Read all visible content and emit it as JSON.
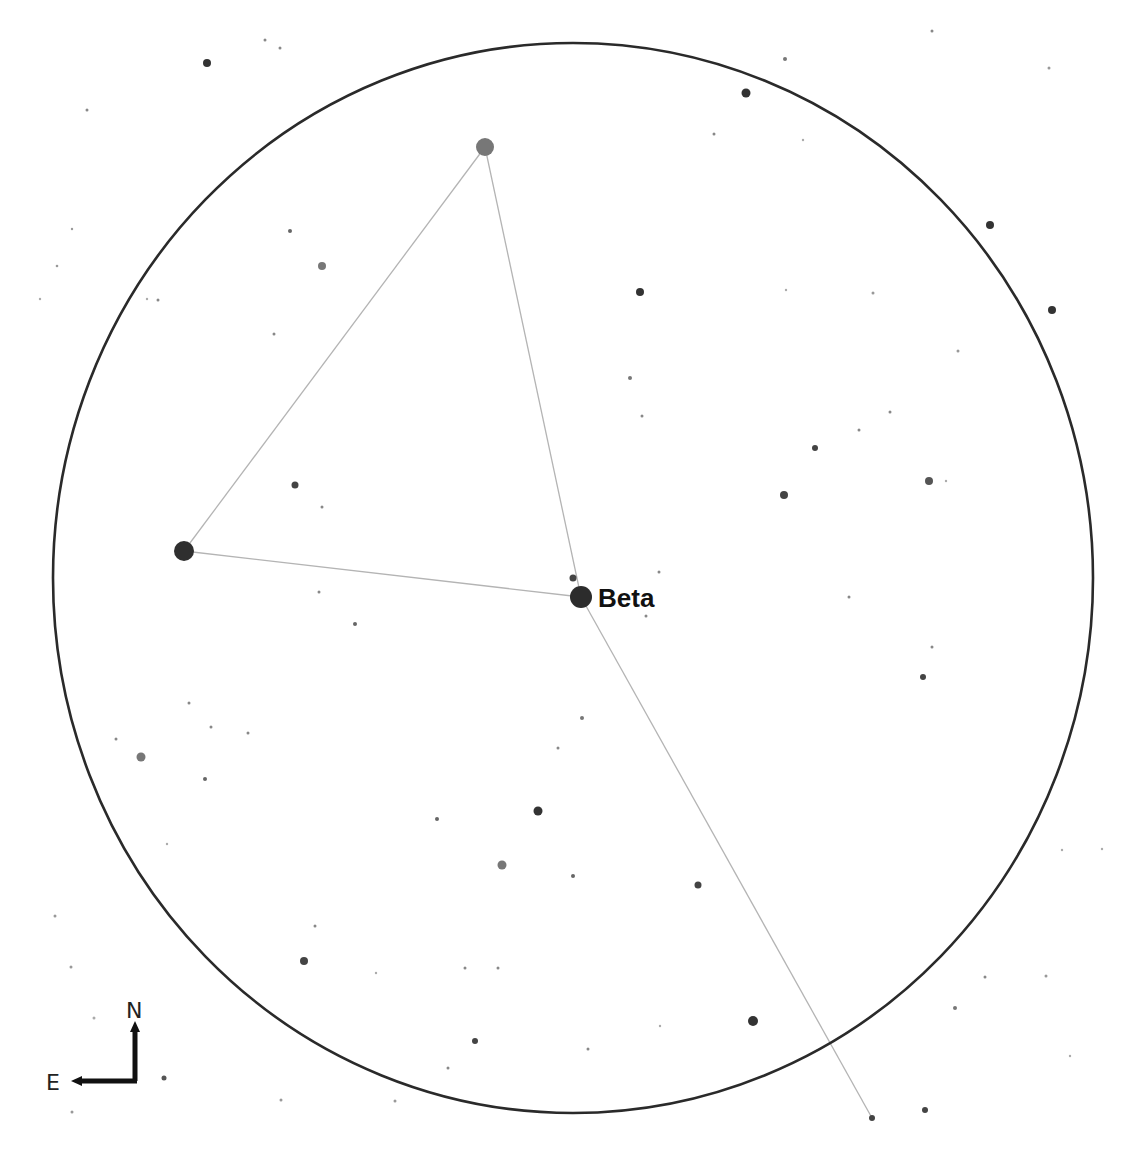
{
  "chart": {
    "background": "#ffffff",
    "fov_circle": {
      "cx": 573,
      "cy": 578,
      "rx": 520,
      "ry": 535,
      "color": "#2a2a2a"
    },
    "label": {
      "text": "Beta",
      "x": 598,
      "y": 607,
      "star_index": 0
    },
    "compass": {
      "north_label": "N",
      "east_label": "E"
    },
    "asterism_lines": [
      {
        "from": [
          485,
          147
        ],
        "to": [
          184,
          551
        ]
      },
      {
        "from": [
          485,
          147
        ],
        "to": [
          581,
          597
        ]
      },
      {
        "from": [
          184,
          551
        ],
        "to": [
          581,
          597
        ]
      },
      {
        "from": [
          581,
          597
        ],
        "to": [
          872,
          1118
        ]
      }
    ],
    "stars": [
      {
        "name": "Beta",
        "x": 581,
        "y": 597,
        "r": 11,
        "color": "#2c2c2c"
      },
      {
        "x": 485,
        "y": 147,
        "r": 9,
        "color": "#777777"
      },
      {
        "x": 184,
        "y": 551,
        "r": 10,
        "color": "#2f2f2f"
      },
      {
        "x": 573,
        "y": 578,
        "r": 3.5,
        "color": "#444444"
      },
      {
        "x": 207,
        "y": 63,
        "r": 4,
        "color": "#333333"
      },
      {
        "x": 265,
        "y": 40,
        "r": 1.5,
        "color": "#888888"
      },
      {
        "x": 280,
        "y": 48,
        "r": 1.5,
        "color": "#888888"
      },
      {
        "x": 87,
        "y": 110,
        "r": 1.5,
        "color": "#888888"
      },
      {
        "x": 72,
        "y": 229,
        "r": 1.2,
        "color": "#999999"
      },
      {
        "x": 57,
        "y": 266,
        "r": 1.3,
        "color": "#999999"
      },
      {
        "x": 40,
        "y": 299,
        "r": 1.2,
        "color": "#aaaaaa"
      },
      {
        "x": 147,
        "y": 299,
        "r": 1.2,
        "color": "#aaaaaa"
      },
      {
        "x": 290,
        "y": 231,
        "r": 2,
        "color": "#666666"
      },
      {
        "x": 322,
        "y": 266,
        "r": 4,
        "color": "#777777"
      },
      {
        "x": 158,
        "y": 300,
        "r": 1.5,
        "color": "#888888"
      },
      {
        "x": 274,
        "y": 334,
        "r": 1.5,
        "color": "#888888"
      },
      {
        "x": 295,
        "y": 485,
        "r": 3.5,
        "color": "#444444"
      },
      {
        "x": 322,
        "y": 507,
        "r": 1.5,
        "color": "#888888"
      },
      {
        "x": 319,
        "y": 592,
        "r": 1.5,
        "color": "#888888"
      },
      {
        "x": 355,
        "y": 624,
        "r": 2,
        "color": "#666666"
      },
      {
        "x": 746,
        "y": 93,
        "r": 4.5,
        "color": "#333333"
      },
      {
        "x": 785,
        "y": 59,
        "r": 2,
        "color": "#777777"
      },
      {
        "x": 932,
        "y": 31,
        "r": 1.5,
        "color": "#888888"
      },
      {
        "x": 1049,
        "y": 68,
        "r": 1.5,
        "color": "#999999"
      },
      {
        "x": 714,
        "y": 134,
        "r": 1.5,
        "color": "#888888"
      },
      {
        "x": 803,
        "y": 140,
        "r": 1.2,
        "color": "#aaaaaa"
      },
      {
        "x": 990,
        "y": 225,
        "r": 4,
        "color": "#333333"
      },
      {
        "x": 640,
        "y": 292,
        "r": 4,
        "color": "#333333"
      },
      {
        "x": 786,
        "y": 290,
        "r": 1.2,
        "color": "#aaaaaa"
      },
      {
        "x": 873,
        "y": 293,
        "r": 1.5,
        "color": "#999999"
      },
      {
        "x": 1052,
        "y": 310,
        "r": 4,
        "color": "#333333"
      },
      {
        "x": 958,
        "y": 351,
        "r": 1.5,
        "color": "#999999"
      },
      {
        "x": 630,
        "y": 378,
        "r": 2,
        "color": "#777777"
      },
      {
        "x": 642,
        "y": 416,
        "r": 1.5,
        "color": "#888888"
      },
      {
        "x": 890,
        "y": 412,
        "r": 1.5,
        "color": "#888888"
      },
      {
        "x": 859,
        "y": 430,
        "r": 1.5,
        "color": "#888888"
      },
      {
        "x": 815,
        "y": 448,
        "r": 3,
        "color": "#444444"
      },
      {
        "x": 784,
        "y": 495,
        "r": 4,
        "color": "#444444"
      },
      {
        "x": 929,
        "y": 481,
        "r": 4,
        "color": "#555555"
      },
      {
        "x": 946,
        "y": 481,
        "r": 1.2,
        "color": "#aaaaaa"
      },
      {
        "x": 659,
        "y": 572,
        "r": 1.5,
        "color": "#888888"
      },
      {
        "x": 646,
        "y": 616,
        "r": 1.5,
        "color": "#888888"
      },
      {
        "x": 849,
        "y": 597,
        "r": 1.5,
        "color": "#888888"
      },
      {
        "x": 932,
        "y": 647,
        "r": 1.5,
        "color": "#888888"
      },
      {
        "x": 923,
        "y": 677,
        "r": 3,
        "color": "#444444"
      },
      {
        "x": 189,
        "y": 703,
        "r": 1.5,
        "color": "#888888"
      },
      {
        "x": 116,
        "y": 739,
        "r": 1.5,
        "color": "#888888"
      },
      {
        "x": 211,
        "y": 727,
        "r": 1.5,
        "color": "#888888"
      },
      {
        "x": 248,
        "y": 733,
        "r": 1.5,
        "color": "#888888"
      },
      {
        "x": 141,
        "y": 757,
        "r": 4.5,
        "color": "#777777"
      },
      {
        "x": 205,
        "y": 779,
        "r": 2,
        "color": "#666666"
      },
      {
        "x": 167,
        "y": 844,
        "r": 1.2,
        "color": "#aaaaaa"
      },
      {
        "x": 582,
        "y": 718,
        "r": 2,
        "color": "#777777"
      },
      {
        "x": 558,
        "y": 748,
        "r": 1.5,
        "color": "#888888"
      },
      {
        "x": 437,
        "y": 819,
        "r": 2,
        "color": "#666666"
      },
      {
        "x": 538,
        "y": 811,
        "r": 4.5,
        "color": "#333333"
      },
      {
        "x": 502,
        "y": 865,
        "r": 4.5,
        "color": "#777777"
      },
      {
        "x": 573,
        "y": 876,
        "r": 2,
        "color": "#666666"
      },
      {
        "x": 698,
        "y": 885,
        "r": 3.5,
        "color": "#444444"
      },
      {
        "x": 55,
        "y": 916,
        "r": 1.5,
        "color": "#999999"
      },
      {
        "x": 315,
        "y": 926,
        "r": 1.5,
        "color": "#888888"
      },
      {
        "x": 304,
        "y": 961,
        "r": 4,
        "color": "#444444"
      },
      {
        "x": 376,
        "y": 973,
        "r": 1.2,
        "color": "#aaaaaa"
      },
      {
        "x": 465,
        "y": 968,
        "r": 1.5,
        "color": "#888888"
      },
      {
        "x": 498,
        "y": 968,
        "r": 1.5,
        "color": "#888888"
      },
      {
        "x": 71,
        "y": 967,
        "r": 1.5,
        "color": "#999999"
      },
      {
        "x": 94,
        "y": 1018,
        "r": 1.5,
        "color": "#aaaaaa"
      },
      {
        "x": 660,
        "y": 1026,
        "r": 1.2,
        "color": "#aaaaaa"
      },
      {
        "x": 753,
        "y": 1021,
        "r": 5,
        "color": "#333333"
      },
      {
        "x": 588,
        "y": 1049,
        "r": 1.5,
        "color": "#888888"
      },
      {
        "x": 475,
        "y": 1041,
        "r": 3,
        "color": "#444444"
      },
      {
        "x": 448,
        "y": 1068,
        "r": 1.5,
        "color": "#888888"
      },
      {
        "x": 395,
        "y": 1101,
        "r": 1.5,
        "color": "#999999"
      },
      {
        "x": 164,
        "y": 1078,
        "r": 2.5,
        "color": "#555555"
      },
      {
        "x": 72,
        "y": 1112,
        "r": 1.5,
        "color": "#999999"
      },
      {
        "x": 281,
        "y": 1100,
        "r": 1.5,
        "color": "#999999"
      },
      {
        "x": 872,
        "y": 1118,
        "r": 3,
        "color": "#444444"
      },
      {
        "x": 925,
        "y": 1110,
        "r": 3,
        "color": "#444444"
      },
      {
        "x": 955,
        "y": 1008,
        "r": 2,
        "color": "#777777"
      },
      {
        "x": 985,
        "y": 977,
        "r": 1.5,
        "color": "#888888"
      },
      {
        "x": 1046,
        "y": 976,
        "r": 1.5,
        "color": "#999999"
      },
      {
        "x": 1062,
        "y": 850,
        "r": 1.2,
        "color": "#aaaaaa"
      },
      {
        "x": 1102,
        "y": 849,
        "r": 1.2,
        "color": "#aaaaaa"
      },
      {
        "x": 1070,
        "y": 1056,
        "r": 1.2,
        "color": "#aaaaaa"
      }
    ]
  }
}
